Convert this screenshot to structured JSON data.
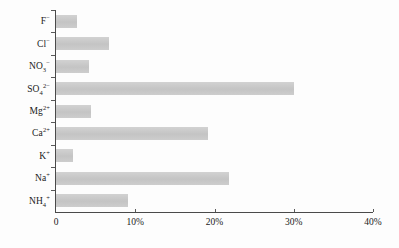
{
  "chart_data": {
    "type": "bar",
    "orientation": "horizontal",
    "title": "",
    "subtitle": "",
    "xlabel": "",
    "ylabel": "",
    "xlim": [
      0,
      40
    ],
    "xunit": "%",
    "grid": false,
    "legend": null,
    "bar_color": "#c9c9c9",
    "axis_color": "#4a4a4a",
    "categories": [
      "F⁻",
      "Cl⁻",
      "NO₃⁻",
      "SO₄²⁻",
      "Mg²⁺",
      "Ca²⁺",
      "K⁺",
      "Na⁺",
      "NH₄⁺"
    ],
    "values": [
      2.6,
      6.7,
      4.2,
      30.0,
      4.4,
      19.2,
      2.1,
      21.8,
      9.1
    ],
    "xticks": [
      0,
      10,
      20,
      30,
      40
    ],
    "xticklabels": [
      "0",
      "10%",
      "20%",
      "30%",
      "40%"
    ],
    "items": [
      {
        "label_main": "F",
        "label_sup": "−",
        "label_sub": "",
        "value": 2.6,
        "name": "bar-fluoride"
      },
      {
        "label_main": "Cl",
        "label_sup": "−",
        "label_sub": "",
        "value": 6.7,
        "name": "bar-chloride"
      },
      {
        "label_main": "NO",
        "label_sup": "−",
        "label_sub": "3",
        "value": 4.2,
        "name": "bar-nitrate"
      },
      {
        "label_main": "SO",
        "label_sup": "2−",
        "label_sub": "4",
        "value": 30.0,
        "name": "bar-sulfate"
      },
      {
        "label_main": "Mg",
        "label_sup": "2+",
        "label_sub": "",
        "value": 4.4,
        "name": "bar-magnesium"
      },
      {
        "label_main": "Ca",
        "label_sup": "2+",
        "label_sub": "",
        "value": 19.2,
        "name": "bar-calcium"
      },
      {
        "label_main": "K",
        "label_sup": "+",
        "label_sub": "",
        "value": 2.1,
        "name": "bar-potassium"
      },
      {
        "label_main": "Na",
        "label_sup": "+",
        "label_sub": "",
        "value": 21.8,
        "name": "bar-sodium"
      },
      {
        "label_main": "NH",
        "label_sup": "+",
        "label_sub": "4",
        "value": 9.1,
        "name": "bar-ammonium"
      }
    ]
  }
}
